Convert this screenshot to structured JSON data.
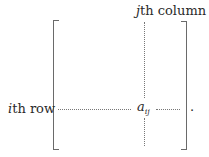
{
  "diagram": {
    "column_label": {
      "index": "j",
      "suffix": "th column"
    },
    "row_label": {
      "index": "i",
      "suffix": "th row"
    },
    "entry": {
      "base": "a",
      "subscript": "ij"
    },
    "trailing_punctuation": "."
  },
  "colors": {
    "text": "#2a2a2a",
    "bracket": "#6a6a6a",
    "dotted_line": "#777777",
    "background": "#ffffff"
  }
}
